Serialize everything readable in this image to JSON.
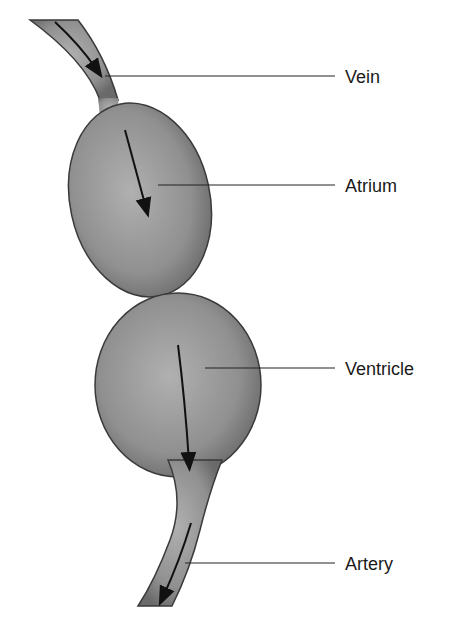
{
  "diagram": {
    "type": "anatomical-flow",
    "labels": [
      {
        "id": "vein",
        "text": "Vein"
      },
      {
        "id": "atrium",
        "text": "Atrium"
      },
      {
        "id": "ventricle",
        "text": "Ventricle"
      },
      {
        "id": "artery",
        "text": "Artery"
      }
    ],
    "flow_direction": "vein → atrium → ventricle → artery",
    "colors": {
      "tissue": "#8f8f8f",
      "outline": "#3a3a3a",
      "line": "#222222"
    }
  }
}
